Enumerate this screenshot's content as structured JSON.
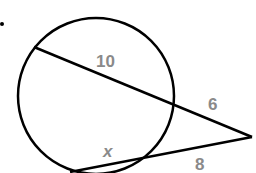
{
  "diagram": {
    "type": "geometry-secant-secant",
    "labels": {
      "chord_external_top": "10",
      "external_top": "6",
      "chord_bottom": "x",
      "external_bottom": "8"
    },
    "colors": {
      "stroke": "#000000",
      "label": "#8a8a8a",
      "background": "#ffffff"
    },
    "bullet": "•"
  }
}
